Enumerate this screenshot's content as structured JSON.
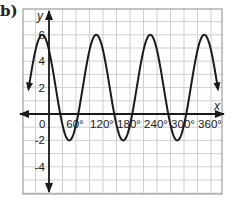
{
  "part_label": "b)",
  "chart_data": {
    "type": "line",
    "title": "",
    "xlabel": "x",
    "ylabel": "y",
    "x_tick_labels": [
      "0",
      "60°",
      "120°",
      "180°",
      "240°",
      "300°",
      "360°"
    ],
    "x_ticks": [
      0,
      60,
      120,
      180,
      240,
      300,
      360
    ],
    "y_tick_labels": [
      "6",
      "4",
      "2",
      "-2",
      "-4"
    ],
    "y_ticks": [
      6,
      4,
      2,
      -2,
      -4
    ],
    "xlim": [
      -60,
      375
    ],
    "ylim": [
      -6.1,
      7.2
    ],
    "grid": true,
    "grid_step_x": 30,
    "grid_step_y": 1,
    "series": [
      {
        "name": "curve",
        "max": 6,
        "min": -2,
        "observed_maxima_x": [
          -15,
          105,
          225,
          345
        ],
        "observed_minima_x": [
          45,
          165,
          285
        ],
        "approx_y_at_x0": 2,
        "x_range": [
          -45,
          375
        ],
        "arrows": "both ends"
      }
    ],
    "legend": null
  },
  "colors": {
    "grid": "#cfcfcf",
    "axis": "#1a1a1a",
    "curve": "#1a1a1a",
    "frame": "#8a8a8a",
    "label": "#222222"
  }
}
